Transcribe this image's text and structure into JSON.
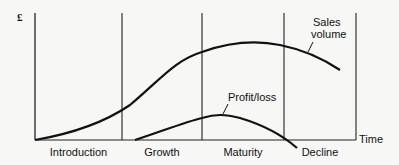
{
  "diagram": {
    "y_axis_label": "£",
    "x_axis_label": "Time",
    "stages": [
      {
        "label": "Introduction",
        "x_start": 35,
        "x_end": 122
      },
      {
        "label": "Growth",
        "x_start": 122,
        "x_end": 202
      },
      {
        "label": "Maturity",
        "x_start": 202,
        "x_end": 284
      },
      {
        "label": "Decline",
        "x_start": 284,
        "x_end": 356
      }
    ],
    "curves": [
      {
        "name": "Sales volume",
        "label_line1": "Sales",
        "label_line2": "volume"
      },
      {
        "name": "Profit/loss",
        "label": "Profit/loss"
      }
    ],
    "colors": {
      "line": "#111111",
      "background": "#f7f7f5"
    }
  }
}
